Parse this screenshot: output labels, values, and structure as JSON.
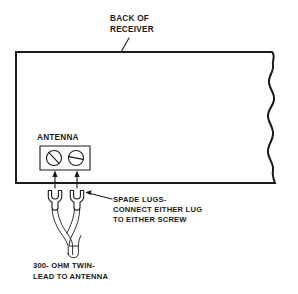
{
  "diagram": {
    "background_color": "#ffffff",
    "line_color": "#1a1a1a",
    "labels": {
      "back_of_receiver_line1": "BACK OF",
      "back_of_receiver_line2": "RECEIVER",
      "antenna_terminal": "ANTENNA",
      "spade_lugs_line1": "SPADE LUGS-",
      "spade_lugs_line2": "CONNECT EITHER LUG",
      "spade_lugs_line3": "TO EITHER SCREW",
      "twin_lead_line1": "300- OHM TWIN-",
      "twin_lead_line2": "LEAD TO ANTENNA"
    },
    "parts": {
      "receiver_panel": "receiver back panel",
      "break_edge": "torn break edge",
      "terminal_strip": "antenna terminal strip",
      "screw_left": "left terminal screw",
      "screw_right": "right terminal screw",
      "lug_left": "left spade lug",
      "lug_right": "right spade lug",
      "twin_lead_cable": "300 ohm twin-lead cable"
    }
  }
}
